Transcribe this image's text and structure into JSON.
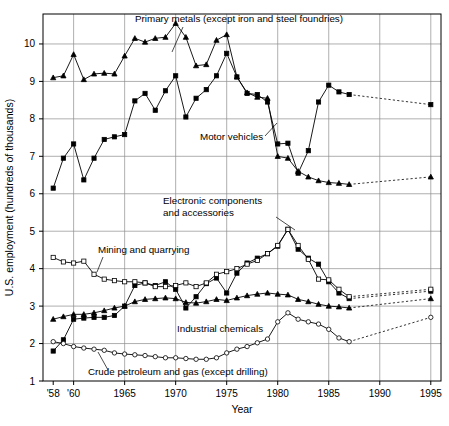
{
  "chart_data": {
    "type": "line",
    "title": "",
    "xlabel": "Year",
    "ylabel": "U.S. employment (hundreds of thousands)",
    "xlim": [
      1957,
      1996
    ],
    "ylim": [
      1,
      10.8
    ],
    "grid": true,
    "legend_position": "inline-annotations",
    "x_ticks": [
      {
        "value": 1958,
        "label": "'58"
      },
      {
        "value": 1960,
        "label": "'60"
      },
      {
        "value": 1965,
        "label": "1965"
      },
      {
        "value": 1970,
        "label": "1970"
      },
      {
        "value": 1975,
        "label": "1975"
      },
      {
        "value": 1980,
        "label": "1980"
      },
      {
        "value": 1985,
        "label": "1985"
      },
      {
        "value": 1990,
        "label": "1990"
      },
      {
        "value": 1995,
        "label": "1995"
      }
    ],
    "x_gridlines": [
      1960,
      1965,
      1970,
      1975,
      1980,
      1985,
      1990,
      1995
    ],
    "y_ticks": [
      {
        "value": 1,
        "label": "1"
      },
      {
        "value": 2,
        "label": "2"
      },
      {
        "value": 3,
        "label": "3"
      },
      {
        "value": 4,
        "label": "4"
      },
      {
        "value": 5,
        "label": "5"
      },
      {
        "value": 6,
        "label": "6"
      },
      {
        "value": 7,
        "label": "7"
      },
      {
        "value": 8,
        "label": "8"
      },
      {
        "value": 9,
        "label": "9"
      },
      {
        "value": 10,
        "label": "10"
      }
    ],
    "y_gridlines": [
      2,
      3,
      4,
      5,
      6,
      7,
      8,
      9,
      10
    ],
    "series": [
      {
        "name": "Primary metals (except iron and steel foundries)",
        "marker": "triangle",
        "fill": "filled",
        "x": [
          1958,
          1959,
          1960,
          1961,
          1962,
          1963,
          1964,
          1965,
          1966,
          1967,
          1968,
          1969,
          1970,
          1971,
          1972,
          1973,
          1974,
          1975,
          1976,
          1977,
          1978,
          1979,
          1980,
          1981,
          1982,
          1983,
          1984,
          1985,
          1986,
          1987,
          1995
        ],
        "y": [
          9.1,
          9.15,
          9.72,
          9.05,
          9.2,
          9.22,
          9.2,
          9.68,
          10.15,
          10.05,
          10.15,
          10.18,
          10.55,
          10.18,
          9.42,
          9.45,
          10.1,
          10.25,
          9.12,
          8.7,
          8.58,
          8.55,
          7.0,
          6.95,
          6.6,
          6.45,
          6.35,
          6.3,
          6.28,
          6.25,
          6.45
        ],
        "dashed_segment_from": 1987
      },
      {
        "name": "Motor vehicles",
        "marker": "square",
        "fill": "filled",
        "x": [
          1958,
          1959,
          1960,
          1961,
          1962,
          1963,
          1964,
          1965,
          1966,
          1967,
          1968,
          1969,
          1970,
          1971,
          1972,
          1973,
          1974,
          1975,
          1976,
          1977,
          1978,
          1979,
          1980,
          1981,
          1982,
          1983,
          1984,
          1985,
          1986,
          1987,
          1995
        ],
        "y": [
          6.15,
          6.95,
          7.33,
          6.37,
          6.95,
          7.45,
          7.52,
          7.58,
          8.48,
          8.68,
          8.23,
          8.75,
          9.15,
          8.05,
          8.55,
          8.78,
          9.15,
          9.75,
          9.12,
          8.68,
          8.65,
          8.45,
          7.33,
          7.35,
          6.55,
          7.15,
          8.45,
          8.9,
          8.72,
          8.65,
          8.38
        ]
      },
      {
        "name": "Electronic components and accessories",
        "marker": "square",
        "fill": "filled",
        "x": [
          1958,
          1959,
          1960,
          1961,
          1962,
          1963,
          1964,
          1965,
          1966,
          1967,
          1968,
          1969,
          1970,
          1971,
          1972,
          1973,
          1974,
          1975,
          1976,
          1977,
          1978,
          1979,
          1980,
          1981,
          1982,
          1983,
          1984,
          1985,
          1986,
          1987,
          1995
        ],
        "y": [
          1.8,
          2.1,
          2.65,
          2.68,
          2.7,
          2.7,
          2.75,
          3.0,
          3.55,
          3.62,
          3.55,
          3.65,
          3.45,
          2.95,
          3.25,
          3.6,
          3.75,
          3.35,
          3.88,
          4.15,
          4.28,
          4.4,
          4.6,
          5.05,
          4.52,
          4.28,
          4.12,
          3.65,
          3.35,
          3.2,
          3.4
        ],
        "dashed_segment_from": 1987
      },
      {
        "name": "Mining and quarrying",
        "marker": "square",
        "fill": "open",
        "x": [
          1958,
          1959,
          1960,
          1961,
          1962,
          1963,
          1964,
          1965,
          1966,
          1967,
          1968,
          1969,
          1970,
          1971,
          1972,
          1973,
          1974,
          1975,
          1976,
          1977,
          1978,
          1979,
          1980,
          1981,
          1982,
          1983,
          1984,
          1985,
          1986,
          1987,
          1995
        ],
        "y": [
          4.3,
          4.18,
          4.15,
          4.2,
          3.85,
          3.72,
          3.68,
          3.65,
          3.65,
          3.62,
          3.52,
          3.52,
          3.55,
          3.62,
          3.52,
          3.62,
          3.85,
          3.92,
          4.0,
          4.12,
          4.22,
          4.4,
          4.62,
          5.05,
          4.62,
          4.25,
          3.72,
          3.7,
          3.45,
          3.25,
          3.45
        ],
        "dashed_segment_from": 1987
      },
      {
        "name": "Industrial chemicals",
        "marker": "triangle",
        "fill": "filled",
        "x": [
          1958,
          1959,
          1960,
          1961,
          1962,
          1963,
          1964,
          1965,
          1966,
          1967,
          1968,
          1969,
          1970,
          1971,
          1972,
          1973,
          1974,
          1975,
          1976,
          1977,
          1978,
          1979,
          1980,
          1981,
          1982,
          1983,
          1984,
          1985,
          1986,
          1987,
          1995
        ],
        "y": [
          2.65,
          2.72,
          2.78,
          2.78,
          2.82,
          2.88,
          2.95,
          3.0,
          3.12,
          3.18,
          3.2,
          3.22,
          3.2,
          3.1,
          3.08,
          3.12,
          3.18,
          3.15,
          3.22,
          3.28,
          3.32,
          3.35,
          3.32,
          3.3,
          3.18,
          3.12,
          3.05,
          3.0,
          2.98,
          2.95,
          3.2
        ]
      },
      {
        "name": "Crude petroleum and gas (except drilling)",
        "marker": "circle",
        "fill": "open",
        "x": [
          1958,
          1959,
          1960,
          1961,
          1962,
          1963,
          1964,
          1965,
          1966,
          1967,
          1968,
          1969,
          1970,
          1971,
          1972,
          1973,
          1974,
          1975,
          1976,
          1977,
          1978,
          1979,
          1980,
          1981,
          1982,
          1983,
          1984,
          1985,
          1986,
          1987,
          1995
        ],
        "y": [
          2.05,
          2.0,
          1.92,
          1.88,
          1.85,
          1.82,
          1.75,
          1.72,
          1.7,
          1.68,
          1.65,
          1.62,
          1.62,
          1.6,
          1.58,
          1.58,
          1.62,
          1.75,
          1.85,
          1.92,
          2.02,
          2.12,
          2.58,
          2.82,
          2.65,
          2.58,
          2.52,
          2.38,
          2.15,
          2.05,
          2.7
        ],
        "dashed_segment_from": 1987
      }
    ],
    "annotations": [
      {
        "text": "Primary metals (except iron and steel foundries)",
        "x": 135,
        "y": 22,
        "anchor": "start",
        "leader": [
          [
            183,
            27
          ],
          [
            172,
            52
          ]
        ]
      },
      {
        "text": "Motor vehicles",
        "x": 200,
        "y": 140,
        "anchor": "start",
        "leader": [
          [
            265,
            136
          ],
          [
            277,
            123
          ]
        ]
      },
      {
        "text": "Electronic components",
        "x": 163,
        "y": 204,
        "anchor": "start",
        "leader": [
          [
            276,
            217
          ],
          [
            295,
            230
          ]
        ]
      },
      {
        "text": "and accessories",
        "x": 163,
        "y": 216,
        "anchor": "start",
        "leader": null
      },
      {
        "text": "Mining and quarrying",
        "x": 98,
        "y": 253,
        "anchor": "start",
        "leader": [
          [
            103,
            257
          ],
          [
            97,
            272
          ]
        ]
      },
      {
        "text": "Industrial chemicals",
        "x": 177,
        "y": 332,
        "anchor": "start",
        "leader": null
      },
      {
        "text": "Crude petroleum and gas (except drilling)",
        "x": 88,
        "y": 375,
        "anchor": "start",
        "leader": [
          [
            108,
            370
          ],
          [
            98,
            352
          ]
        ]
      }
    ]
  }
}
